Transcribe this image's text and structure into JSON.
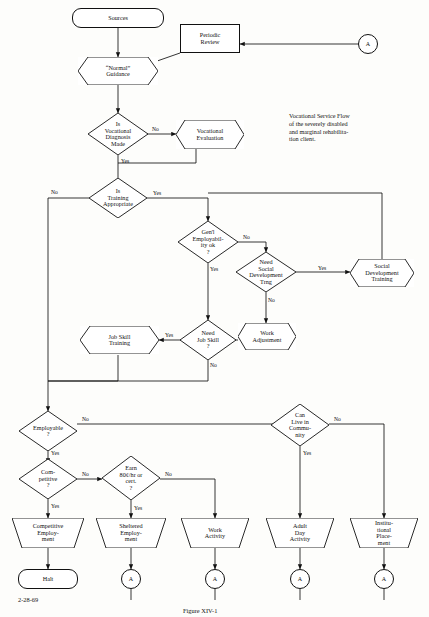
{
  "diagram": {
    "note": "Vocational Service Flow\nof the severely disabled\nand marginal rehabilita-\ntion client.",
    "date_stamp": "2-28-69",
    "figure_caption": "Figure XIV-1",
    "nodes": [
      {
        "id": "sources",
        "label": "Sources",
        "shape": "rounded-rect"
      },
      {
        "id": "periodic",
        "label": "Periodic\nReview",
        "shape": "rect"
      },
      {
        "id": "conn_a_top",
        "label": "A",
        "shape": "circle"
      },
      {
        "id": "normal",
        "label": "“Normal”\nGuidance",
        "shape": "hexagon"
      },
      {
        "id": "voc_diag",
        "label": "Is\nVocational\nDiagnosis\nMade",
        "shape": "diamond"
      },
      {
        "id": "voc_eval",
        "label": "Vocational\nEvaluation",
        "shape": "hexagon"
      },
      {
        "id": "training_appr",
        "label": "Is\nTraining\nAppropriate",
        "shape": "diamond"
      },
      {
        "id": "gen_employ",
        "label": "Gen'l\nEmployabil-\nity ok\n?",
        "shape": "diamond"
      },
      {
        "id": "need_social",
        "label": "Need\nSocial\nDevelopment\nTrng",
        "shape": "diamond"
      },
      {
        "id": "social_dev",
        "label": "Social\nDevelopment\nTraining",
        "shape": "hexagon"
      },
      {
        "id": "work_adjust",
        "label": "Work\nAdjustment",
        "shape": "hexagon"
      },
      {
        "id": "need_job_skill",
        "label": "Need\nJob Skill\n?",
        "shape": "diamond"
      },
      {
        "id": "job_skill",
        "label": "Job Skill\nTraining",
        "shape": "hexagon"
      },
      {
        "id": "employable",
        "label": "Employable\n?",
        "shape": "diamond"
      },
      {
        "id": "competitive_q",
        "label": "Com-\npetitive\n?",
        "shape": "diamond"
      },
      {
        "id": "earn_q",
        "label": "Earn\n80¢/hr or\ncert.\n?",
        "shape": "diamond"
      },
      {
        "id": "live_comm",
        "label": "Can\nLive in\nCommu-\nnity",
        "shape": "diamond"
      },
      {
        "id": "comp_emp",
        "label": "Competitive\nEmploy-\nment",
        "shape": "trapezoid"
      },
      {
        "id": "shelt_emp",
        "label": "Sheltered\nEmploy-\nment",
        "shape": "trapezoid"
      },
      {
        "id": "work_act",
        "label": "Work\nActivity",
        "shape": "trapezoid"
      },
      {
        "id": "adult_day",
        "label": "Adult\nDay\nActivity",
        "shape": "trapezoid"
      },
      {
        "id": "inst_place",
        "label": "Institu-\ntional\nPlace-\nment",
        "shape": "trapezoid"
      },
      {
        "id": "halt",
        "label": "Halt",
        "shape": "rounded-rect"
      },
      {
        "id": "conn_a1",
        "label": "A",
        "shape": "circle"
      },
      {
        "id": "conn_a2",
        "label": "A",
        "shape": "circle"
      },
      {
        "id": "conn_a3",
        "label": "A",
        "shape": "circle"
      },
      {
        "id": "conn_a4",
        "label": "A",
        "shape": "circle"
      }
    ],
    "edge_labels": [
      {
        "id": "e1",
        "text": "No"
      },
      {
        "id": "e2",
        "text": "Yes"
      },
      {
        "id": "e3",
        "text": "No"
      },
      {
        "id": "e4",
        "text": "Yes"
      },
      {
        "id": "e5",
        "text": "No"
      },
      {
        "id": "e6",
        "text": "Yes"
      },
      {
        "id": "e7",
        "text": "Yes"
      },
      {
        "id": "e8",
        "text": "No"
      },
      {
        "id": "e9",
        "text": "Yes"
      },
      {
        "id": "e10",
        "text": "No"
      },
      {
        "id": "e11",
        "text": "No"
      },
      {
        "id": "e12",
        "text": "Yes"
      },
      {
        "id": "e13",
        "text": "No"
      },
      {
        "id": "e14",
        "text": "Yes"
      },
      {
        "id": "e15",
        "text": "No"
      },
      {
        "id": "e16",
        "text": "Yes"
      },
      {
        "id": "e17",
        "text": "No"
      },
      {
        "id": "e18",
        "text": "Yes"
      },
      {
        "id": "e19",
        "text": "Yes"
      }
    ]
  }
}
